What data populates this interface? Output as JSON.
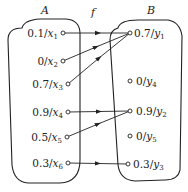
{
  "diagram": {
    "type": "fuzzy-mapping",
    "set_a": {
      "label": "A",
      "elements": [
        {
          "id": "x1",
          "grade": "0.1",
          "name": "x",
          "sub": "1"
        },
        {
          "id": "x2",
          "grade": "0",
          "name": "x",
          "sub": "2"
        },
        {
          "id": "x3",
          "grade": "0.7",
          "name": "x",
          "sub": "3"
        },
        {
          "id": "x4",
          "grade": "0.9",
          "name": "x",
          "sub": "4"
        },
        {
          "id": "x5",
          "grade": "0.5",
          "name": "x",
          "sub": "5"
        },
        {
          "id": "x6",
          "grade": "0.3",
          "name": "x",
          "sub": "6"
        }
      ]
    },
    "mapping_label": "f",
    "set_b": {
      "label": "B",
      "elements": [
        {
          "id": "y1",
          "grade": "0.7",
          "name": "y",
          "sub": "1"
        },
        {
          "id": "y4",
          "grade": "0",
          "name": "y",
          "sub": "4"
        },
        {
          "id": "y2",
          "grade": "0.9",
          "name": "y",
          "sub": "2"
        },
        {
          "id": "y5",
          "grade": "0",
          "name": "y",
          "sub": "5"
        },
        {
          "id": "y3",
          "grade": "0.3",
          "name": "y",
          "sub": "3"
        }
      ]
    },
    "edges": [
      {
        "from": "x1",
        "to": "y1"
      },
      {
        "from": "x2",
        "to": "y1"
      },
      {
        "from": "x3",
        "to": "y1"
      },
      {
        "from": "x4",
        "to": "y2"
      },
      {
        "from": "x5",
        "to": "y2"
      },
      {
        "from": "x6",
        "to": "y3"
      }
    ],
    "colors": {
      "stroke": "#222222",
      "background": "#ffffff"
    }
  }
}
